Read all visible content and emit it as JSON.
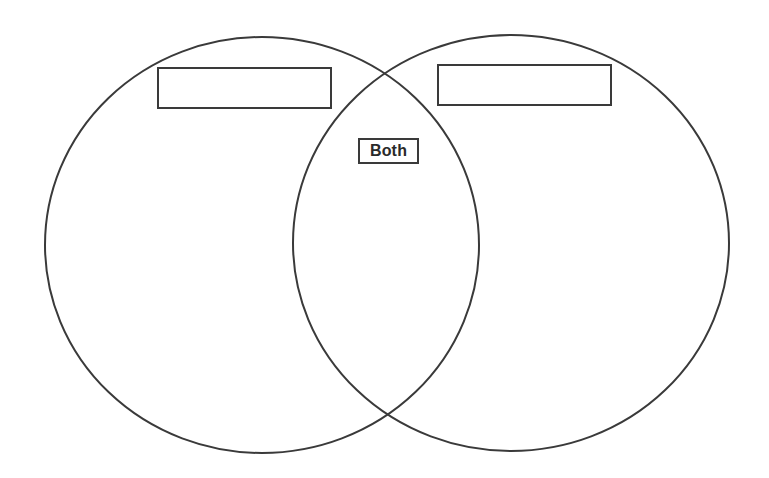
{
  "diagram": {
    "type": "venn",
    "sets": [
      {
        "id": "left",
        "label": ""
      },
      {
        "id": "right",
        "label": ""
      }
    ],
    "intersection": {
      "label": "Both"
    },
    "stroke_color": "#3a3a3a",
    "background_color": "#ffffff"
  }
}
